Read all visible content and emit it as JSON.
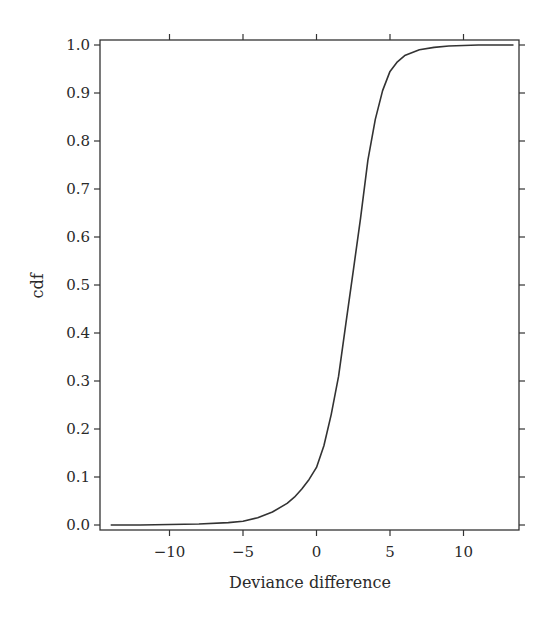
{
  "chart_data": {
    "type": "line",
    "title": "",
    "xlabel": "Deviance difference",
    "ylabel": "cdf",
    "xlim": [
      -14.4,
      13.8
    ],
    "ylim": [
      -0.01,
      1.01
    ],
    "xticks": [
      -10,
      -5,
      0,
      5,
      10
    ],
    "xtick_labels": [
      "−10",
      "−5",
      "0",
      "5",
      "10"
    ],
    "yticks": [
      0.0,
      0.1,
      0.2,
      0.3,
      0.4,
      0.5,
      0.6,
      0.7,
      0.8,
      0.9,
      1.0
    ],
    "ytick_labels": [
      "0.0",
      "0.1",
      "0.2",
      "0.3",
      "0.4",
      "0.5",
      "0.6",
      "0.7",
      "0.8",
      "0.9",
      "1.0"
    ],
    "grid": false,
    "legend": null,
    "line_color": "#333333",
    "series": [
      {
        "name": "cdf",
        "x": [
          -14.0,
          -12.0,
          -10.0,
          -8.0,
          -6.0,
          -5.0,
          -4.0,
          -3.0,
          -2.0,
          -1.5,
          -1.0,
          -0.5,
          0.0,
          0.5,
          1.0,
          1.5,
          2.0,
          2.5,
          3.0,
          3.5,
          4.0,
          4.5,
          5.0,
          5.5,
          6.0,
          7.0,
          8.0,
          9.0,
          10.0,
          11.0,
          12.0,
          13.4
        ],
        "y": [
          0.0,
          0.0,
          0.001,
          0.002,
          0.005,
          0.008,
          0.015,
          0.027,
          0.045,
          0.058,
          0.075,
          0.095,
          0.12,
          0.165,
          0.23,
          0.31,
          0.42,
          0.53,
          0.64,
          0.76,
          0.845,
          0.905,
          0.945,
          0.965,
          0.978,
          0.99,
          0.995,
          0.998,
          0.999,
          1.0,
          1.0,
          1.0
        ]
      }
    ]
  }
}
